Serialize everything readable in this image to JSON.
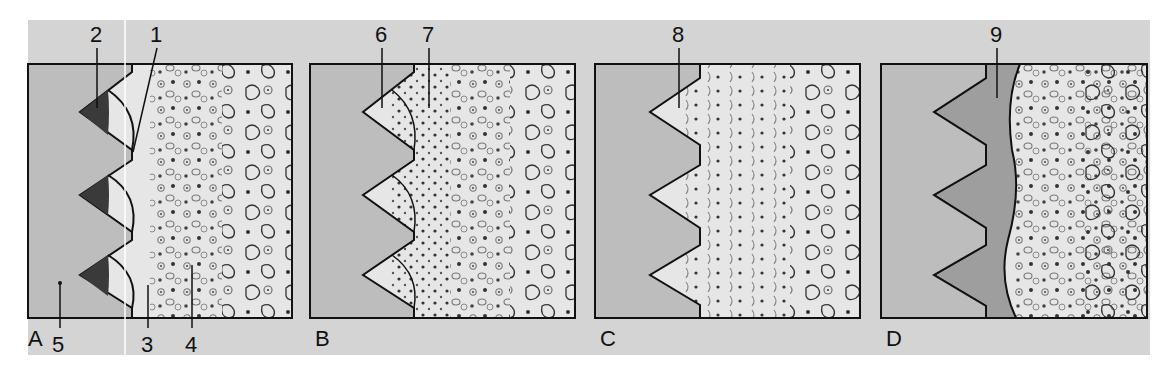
{
  "figure": {
    "colors": {
      "strip_background": "#d4d4d4",
      "solid_region": "#bdbdbd",
      "tissue_region": "#e6e6e6",
      "dark_triangle": "#3a3a3a",
      "dense_band": "#9e9e9e",
      "outline": "#111111"
    },
    "panels": [
      {
        "letter": "A",
        "callouts": [
          {
            "number": "1",
            "target": "boundary notch"
          },
          {
            "number": "2",
            "target": "dark triangular zone"
          },
          {
            "number": "3",
            "target": "inner cell layer"
          },
          {
            "number": "4",
            "target": "cellular tissue"
          },
          {
            "number": "5",
            "target": "solid gray region"
          }
        ]
      },
      {
        "letter": "B",
        "callouts": [
          {
            "number": "6",
            "target": "dotted triangular zone"
          },
          {
            "number": "7",
            "target": "cell-dense layer"
          }
        ]
      },
      {
        "letter": "C",
        "callouts": [
          {
            "number": "8",
            "target": "sawtooth interface tissue"
          }
        ]
      },
      {
        "letter": "D",
        "callouts": [
          {
            "number": "9",
            "target": "dense continuous band"
          }
        ]
      }
    ]
  }
}
